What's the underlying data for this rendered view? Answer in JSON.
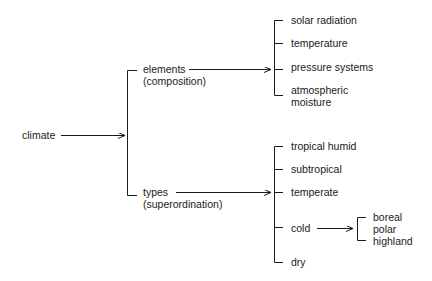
{
  "root": {
    "label": "climate"
  },
  "branches": [
    {
      "label": "elements",
      "sublabel": "(composition)",
      "children": [
        "solar radiation",
        "temperature",
        "pressure systems",
        "atmospheric",
        "moisture"
      ]
    },
    {
      "label": "types",
      "sublabel": "(superordination)",
      "children": [
        "tropical humid",
        "subtropical",
        "temperate",
        "cold",
        "dry"
      ],
      "cold_subtypes": [
        "boreal",
        "polar",
        "highland"
      ]
    }
  ],
  "colors": {
    "line": "#1a1a1a",
    "background": "#ffffff"
  }
}
